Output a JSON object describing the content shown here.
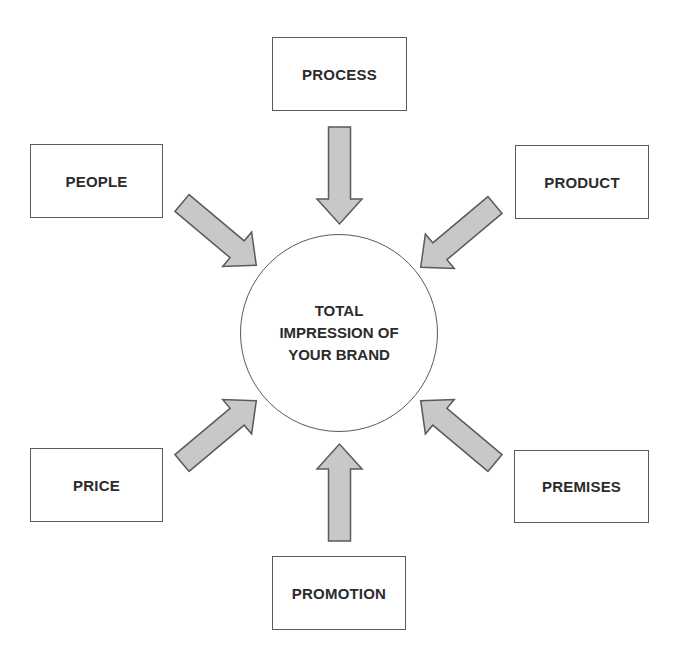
{
  "diagram": {
    "center": {
      "lines": [
        "TOTAL",
        "IMPRESSION OF",
        "YOUR BRAND"
      ]
    },
    "nodes": {
      "process": "PROCESS",
      "people": "PEOPLE",
      "product": "PRODUCT",
      "price": "PRICE",
      "premises": "PREMISES",
      "promotion": "PROMOTION"
    },
    "edges": [
      {
        "from": "process",
        "to": "center"
      },
      {
        "from": "people",
        "to": "center"
      },
      {
        "from": "product",
        "to": "center"
      },
      {
        "from": "price",
        "to": "center"
      },
      {
        "from": "premises",
        "to": "center"
      },
      {
        "from": "promotion",
        "to": "center"
      }
    ],
    "colors": {
      "arrow_fill": "#c8c8c8",
      "stroke": "#5a5a5a",
      "text": "#2b2b2b"
    }
  }
}
